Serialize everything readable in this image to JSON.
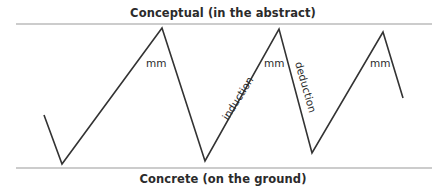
{
  "diagram": {
    "top_label": "Conceptual (in the abstract)",
    "bottom_label": "Concrete (on the ground)",
    "mm_label": "mm",
    "induction_label": "induction",
    "deduction_label": "deduction",
    "colors": {
      "line": "#333333",
      "rule": "#9a9a9a",
      "text": "#2b2b2b"
    },
    "zigzag_points": [
      [
        44,
        115
      ],
      [
        62,
        164
      ],
      [
        162,
        28
      ],
      [
        205,
        161
      ],
      [
        279,
        29
      ],
      [
        312,
        153
      ],
      [
        383,
        32
      ],
      [
        403,
        98
      ]
    ]
  }
}
